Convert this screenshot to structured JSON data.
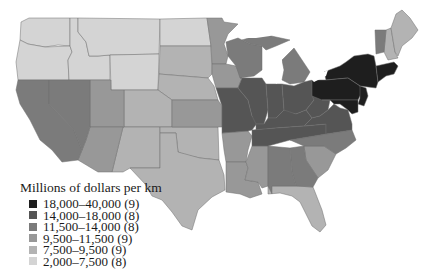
{
  "legend": {
    "title": "Millions of dollars per km",
    "items": [
      {
        "label": "18,000–40,000 (9)",
        "color": "#1e1e1e"
      },
      {
        "label": "14,000–18,000 (8)",
        "color": "#555555"
      },
      {
        "label": "11,500–14,000 (8)",
        "color": "#7b7b7b"
      },
      {
        "label": "9,500–11,500 (9)",
        "color": "#989898"
      },
      {
        "label": "7,500–9,500 (9)",
        "color": "#b3b3b3"
      },
      {
        "label": "2,000–7,500 (8)",
        "color": "#d4d4d4"
      }
    ]
  },
  "map": {
    "subject": "Contiguous United States, states shaded by class",
    "classes": {
      "c1": [
        "New York",
        "Pennsylvania",
        "New Jersey",
        "Maryland",
        "Delaware",
        "Connecticut",
        "Rhode Island",
        "Massachusetts",
        "District of Columbia"
      ],
      "c2": [
        "Illinois",
        "Indiana",
        "Ohio",
        "Kentucky",
        "Tennessee",
        "West Virginia",
        "Virginia",
        "Missouri"
      ],
      "c3": [
        "Wisconsin",
        "Michigan",
        "North Carolina",
        "Georgia",
        "Alabama",
        "California",
        "Nevada",
        "Vermont"
      ],
      "c4": [
        "Minnesota",
        "Iowa",
        "Kansas",
        "Arkansas",
        "South Carolina",
        "Mississippi",
        "Louisiana",
        "Arizona",
        "Utah"
      ],
      "c5": [
        "Texas",
        "Oklahoma",
        "Florida",
        "New Mexico",
        "Colorado",
        "Nebraska",
        "South Dakota",
        "New Hampshire",
        "Maine"
      ],
      "c6": [
        "Washington",
        "Oregon",
        "Idaho",
        "Montana",
        "Wyoming",
        "North Dakota"
      ]
    }
  }
}
